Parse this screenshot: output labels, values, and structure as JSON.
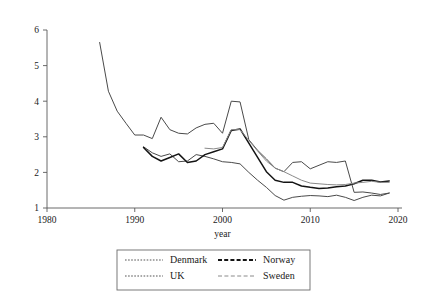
{
  "chart_data": {
    "type": "line",
    "title": "",
    "xlabel": "year",
    "ylabel": "",
    "xlim": [
      1980,
      2020
    ],
    "ylim": [
      1,
      6
    ],
    "xticks": [
      1980,
      1990,
      2000,
      2010,
      2020
    ],
    "yticks": [
      1,
      2,
      3,
      4,
      5,
      6
    ],
    "grid": false,
    "legend_position": "bottom",
    "series": [
      {
        "name": "Denmark",
        "color": "#4a4a4a",
        "style": "dotted",
        "x": [
          1991,
          1992,
          1993,
          1994,
          1995,
          1996,
          1997,
          1998,
          1999,
          2000,
          2001,
          2002,
          2003,
          2004,
          2005,
          2006,
          2007,
          2008,
          2009,
          2010,
          2011,
          2012,
          2013,
          2014,
          2015,
          2016,
          2017,
          2018,
          2019
        ],
        "values": [
          2.72,
          2.55,
          2.45,
          2.52,
          2.3,
          2.32,
          2.5,
          2.45,
          2.38,
          2.3,
          2.28,
          2.24,
          2.0,
          1.78,
          1.58,
          1.35,
          1.22,
          1.3,
          1.33,
          1.35,
          1.34,
          1.32,
          1.36,
          1.3,
          1.21,
          1.3,
          1.36,
          1.34,
          1.42
        ]
      },
      {
        "name": "Norway",
        "color": "#141414",
        "style": "solid-thick",
        "x": [
          1991,
          1992,
          1993,
          1994,
          1995,
          1996,
          1997,
          1998,
          1999,
          2000,
          2001,
          2002,
          2003,
          2004,
          2005,
          2006,
          2007,
          2008,
          2009,
          2010,
          2011,
          2012,
          2013,
          2014,
          2015,
          2016,
          2017,
          2018,
          2019
        ],
        "values": [
          2.7,
          2.45,
          2.32,
          2.42,
          2.52,
          2.28,
          2.32,
          2.5,
          2.58,
          2.66,
          3.18,
          3.22,
          2.82,
          2.42,
          2.02,
          1.78,
          1.72,
          1.72,
          1.62,
          1.58,
          1.55,
          1.56,
          1.6,
          1.62,
          1.68,
          1.78,
          1.78,
          1.73,
          1.76
        ]
      },
      {
        "name": "UK",
        "color": "#4a4a4a",
        "style": "dotted",
        "x": [
          1986,
          1987,
          1988,
          1989,
          1990,
          1991,
          1992,
          1993,
          1994,
          1995,
          1996,
          1997,
          1998,
          1999,
          2000,
          2001,
          2002,
          2003,
          2004,
          2005,
          2006,
          2007,
          2008,
          2009,
          2010,
          2011,
          2012,
          2013,
          2014,
          2015,
          2016,
          2017,
          2018,
          2019
        ],
        "values": [
          5.65,
          4.28,
          3.72,
          3.38,
          3.05,
          3.05,
          2.95,
          3.55,
          3.2,
          3.1,
          3.08,
          3.25,
          3.35,
          3.38,
          3.1,
          4.0,
          3.98,
          2.92,
          2.62,
          2.38,
          2.12,
          2.02,
          2.28,
          2.3,
          2.1,
          2.2,
          2.3,
          2.28,
          2.32,
          1.44,
          1.45,
          1.42,
          1.38,
          1.42
        ]
      },
      {
        "name": "Sweden",
        "color": "#8a8a8a",
        "style": "dashed",
        "x": [
          1998,
          1999,
          2000,
          2001,
          2002,
          2003,
          2004,
          2005,
          2006,
          2007,
          2008,
          2009,
          2010,
          2011,
          2012,
          2013,
          2014,
          2015,
          2016,
          2017,
          2018,
          2019
        ],
        "values": [
          2.68,
          2.66,
          2.7,
          3.2,
          3.2,
          2.9,
          2.6,
          2.32,
          2.12,
          2.02,
          1.9,
          1.78,
          1.7,
          1.68,
          1.66,
          1.65,
          1.66,
          1.7,
          1.72,
          1.75,
          1.72,
          1.72
        ]
      }
    ],
    "legend": [
      {
        "label": "Denmark",
        "style": "dotted",
        "color": "#4a4a4a"
      },
      {
        "label": "Norway",
        "style": "dashed-thick",
        "color": "#141414"
      },
      {
        "label": "UK",
        "style": "dotted",
        "color": "#4a4a4a"
      },
      {
        "label": "Sweden",
        "style": "dashed",
        "color": "#8a8a8a"
      }
    ]
  }
}
